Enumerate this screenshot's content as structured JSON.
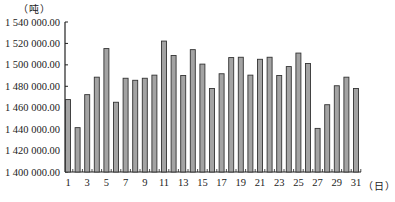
{
  "chart_data": {
    "type": "bar",
    "title": "",
    "xlabel": "（日）",
    "ylabel": "（吨）",
    "ylim": [
      1400000,
      1540000
    ],
    "yticks": [
      1400000,
      1420000,
      1440000,
      1460000,
      1480000,
      1500000,
      1520000,
      1540000
    ],
    "ytick_labels": [
      "1 400 000.00",
      "1 420 000.00",
      "1 440 000.00",
      "1 460 000.00",
      "1 480 000.00",
      "1 500 000.00",
      "1 520 000.00",
      "1 540 000.00"
    ],
    "xtick_labels": [
      "1",
      "3",
      "5",
      "7",
      "9",
      "11",
      "13",
      "15",
      "17",
      "19",
      "21",
      "23",
      "25",
      "27",
      "29",
      "31"
    ],
    "categories": [
      1,
      2,
      3,
      4,
      5,
      6,
      7,
      8,
      9,
      10,
      11,
      12,
      13,
      14,
      15,
      16,
      17,
      18,
      19,
      20,
      21,
      22,
      23,
      24,
      25,
      26,
      27,
      28,
      29,
      30,
      31
    ],
    "values": [
      1467600,
      1441400,
      1472200,
      1488500,
      1515200,
      1465100,
      1487500,
      1485600,
      1487500,
      1490400,
      1522200,
      1508700,
      1490100,
      1514200,
      1500700,
      1477900,
      1491700,
      1506800,
      1507100,
      1490400,
      1505200,
      1507100,
      1490100,
      1498400,
      1511000,
      1501300,
      1440700,
      1462800,
      1480500,
      1488500,
      1477900
    ],
    "grid": false,
    "legend": null,
    "colors": {
      "bar_fill": "#a3a3a3",
      "bar_edge": "#333333",
      "axis": "#222222"
    }
  }
}
